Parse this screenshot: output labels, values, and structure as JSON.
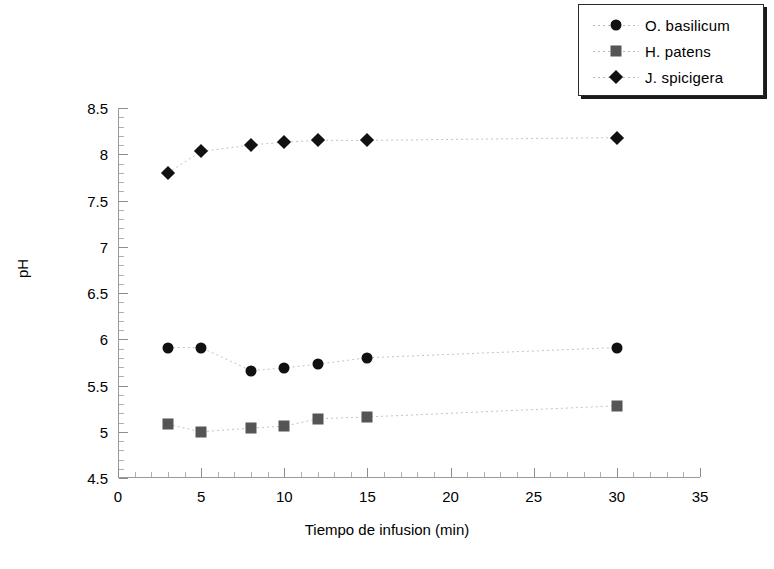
{
  "chart_data": {
    "type": "line",
    "title": "",
    "xlabel": "Tiempo de infusion (min)",
    "ylabel": "pH",
    "xlim": [
      0,
      35
    ],
    "ylim": [
      4.5,
      8.5
    ],
    "xticks": [
      0,
      5,
      10,
      15,
      20,
      25,
      30,
      35
    ],
    "xtick_labels": [
      "0",
      "5",
      "10",
      "15",
      "20",
      "25",
      "30",
      "35"
    ],
    "yticks": [
      4.5,
      5,
      5.5,
      6,
      6.5,
      7,
      7.5,
      8,
      8.5
    ],
    "ytick_labels": [
      "4.5",
      "5",
      "5.5",
      "6",
      "6.5",
      "7",
      "7.5",
      "8",
      "8.5"
    ],
    "grid": false,
    "legend_position": "top-right",
    "x": [
      3,
      5,
      8,
      10,
      12,
      15,
      30
    ],
    "series": [
      {
        "name": "O. basilicum",
        "marker": "circle",
        "color": "#111111",
        "values": [
          5.91,
          5.91,
          5.66,
          5.69,
          5.73,
          5.8,
          5.91
        ]
      },
      {
        "name": "H. patens",
        "marker": "square",
        "color": "#555555",
        "values": [
          5.08,
          5.0,
          5.04,
          5.06,
          5.14,
          5.16,
          5.28
        ]
      },
      {
        "name": "J. spicigera",
        "marker": "diamond",
        "color": "#111111",
        "values": [
          7.8,
          8.03,
          8.1,
          8.13,
          8.15,
          8.15,
          8.18
        ]
      }
    ]
  },
  "legend": {
    "items": [
      {
        "label": "O. basilicum",
        "marker": "circle"
      },
      {
        "label": "H. patens",
        "marker": "square"
      },
      {
        "label": "J. spicigera",
        "marker": "diamond"
      }
    ]
  }
}
